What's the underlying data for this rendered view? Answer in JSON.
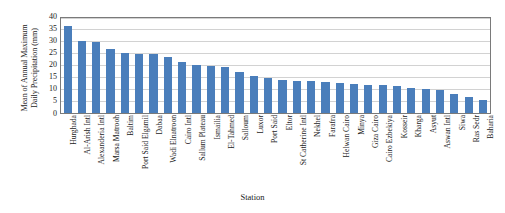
{
  "chart_data": {
    "type": "bar",
    "title": "",
    "xlabel": "Station",
    "ylabel_lines": [
      "Mean of Annual Maximum",
      "Daily Precipitation (mm)"
    ],
    "ylabel": "Mean of Annual Maximum Daily Precipitation (mm)",
    "ylim": [
      0,
      40
    ],
    "yticks": [
      40,
      35,
      30,
      25,
      20,
      15,
      10,
      5,
      0
    ],
    "grid": true,
    "legend": "none",
    "bar_color": "#4a7ebb",
    "categories": [
      "Hurghada",
      "Al-Arish Intl",
      "Alexanderia Intl",
      "Marsa Matrooh",
      "Baltim",
      "Port Said Elgamil",
      "Dabaa",
      "Wadi Elnatroon",
      "Cairo Intl",
      "Sallum Plateau",
      "Ismailia",
      "El-Tahmed",
      "Salloum",
      "Luxor",
      "Port Said",
      "Eltor",
      "St Catherine Intl",
      "Nekhel",
      "Farafra",
      "Helwan Cairo",
      "Minya",
      "Giza Cairo",
      "Cairo Ezbekiya",
      "Kosseir",
      "Kharga",
      "Asyut",
      "Aswan Intl",
      "Siwa",
      "Ras Sedr",
      "Baharia"
    ],
    "values": [
      35.5,
      29.5,
      29.0,
      26.2,
      24.6,
      24.2,
      24.0,
      22.8,
      20.7,
      19.8,
      19.3,
      18.7,
      16.7,
      15.0,
      14.2,
      13.6,
      13.2,
      12.8,
      12.4,
      12.0,
      11.6,
      11.4,
      11.2,
      11.0,
      10.2,
      9.6,
      9.3,
      7.5,
      6.2,
      5.0
    ]
  }
}
